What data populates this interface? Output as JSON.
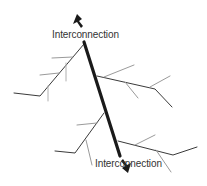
{
  "diagram": {
    "labels": {
      "top": "Interconnection",
      "bottom": "Interconnection"
    },
    "colors": {
      "trunk": "#1a1a1a",
      "branch": "#3a3a3a",
      "twig": "#9a9a9a",
      "text": "#333333"
    },
    "nodes": [
      {
        "id": "trunk",
        "type": "thick-line"
      },
      {
        "id": "branch-upper-left",
        "type": "branch"
      },
      {
        "id": "branch-upper-right",
        "type": "branch"
      },
      {
        "id": "branch-lower-left",
        "type": "branch"
      },
      {
        "id": "branch-lower-right",
        "type": "branch"
      }
    ],
    "arrows": [
      {
        "id": "arrow-top",
        "direction": "up"
      },
      {
        "id": "arrow-bottom",
        "direction": "down"
      }
    ]
  }
}
